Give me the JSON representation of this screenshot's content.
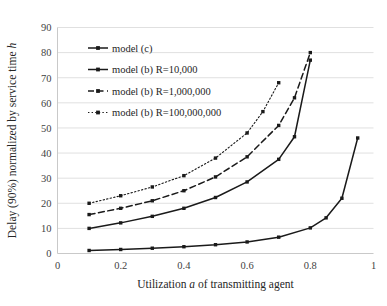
{
  "chart_data": {
    "type": "line",
    "title": "",
    "xlabel": "Utilization a of transmitting agent",
    "xlabel_parts": {
      "pre": "Utilization ",
      "em": "a",
      "post": " of transmitting agent"
    },
    "ylabel": "Delay (90%) normalized by service time h",
    "ylabel_parts": {
      "pre": "Delay (90%) normalized by service time ",
      "em": "h"
    },
    "xlim": [
      0,
      1
    ],
    "ylim": [
      0,
      90
    ],
    "xticks": [
      0,
      0.2,
      0.4,
      0.6,
      0.8,
      1
    ],
    "xtick_labels": [
      "0",
      "0.2",
      "0.4",
      "0.6",
      "0.8",
      "1"
    ],
    "yticks": [
      0,
      10,
      20,
      30,
      40,
      50,
      60,
      70,
      80,
      90
    ],
    "ytick_labels": [
      "0",
      "10",
      "20",
      "30",
      "40",
      "50",
      "60",
      "70",
      "80",
      "90"
    ],
    "grid": true,
    "grid_axis": "y",
    "legend_position": "upper-left-inside",
    "series": [
      {
        "name": "model (c)",
        "dash": "solid",
        "marker": "square",
        "x": [
          0.1,
          0.2,
          0.3,
          0.4,
          0.5,
          0.6,
          0.7,
          0.8,
          0.85,
          0.9,
          0.95
        ],
        "values": [
          1.2,
          1.6,
          2.1,
          2.7,
          3.5,
          4.6,
          6.5,
          10.2,
          14.2,
          22.0,
          46.0
        ]
      },
      {
        "name": "model (b) R=10,000",
        "dash": "solid",
        "marker": "square",
        "x": [
          0.1,
          0.2,
          0.3,
          0.4,
          0.5,
          0.6,
          0.7,
          0.75,
          0.8
        ],
        "values": [
          10.0,
          12.2,
          14.8,
          18.0,
          22.3,
          28.5,
          37.5,
          46.5,
          77.0
        ]
      },
      {
        "name": "model (b) R=1,000,000",
        "dash": "dashed",
        "marker": "square",
        "x": [
          0.1,
          0.2,
          0.3,
          0.4,
          0.5,
          0.6,
          0.7,
          0.75,
          0.8
        ],
        "values": [
          15.5,
          18.0,
          21.0,
          25.0,
          30.5,
          38.5,
          51.0,
          62.0,
          80.0
        ]
      },
      {
        "name": "model (b) R=100,000,000",
        "dash": "dotted",
        "marker": "square",
        "x": [
          0.1,
          0.2,
          0.3,
          0.4,
          0.5,
          0.6,
          0.65,
          0.7
        ],
        "values": [
          20.0,
          23.0,
          26.5,
          31.0,
          38.0,
          48.0,
          56.5,
          68.0
        ]
      }
    ]
  },
  "colors": {
    "line": "#1a1a1a",
    "grid": "#e0e0e0",
    "axis": "#c9c9c9",
    "text": "#262626",
    "background": "#ffffff"
  }
}
